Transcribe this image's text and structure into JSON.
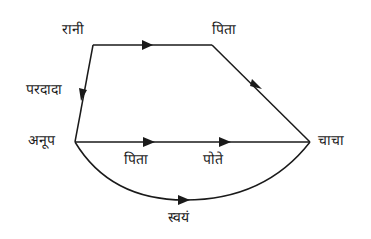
{
  "diagram": {
    "type": "family-relation-graph",
    "line_color": "#1a1a1a",
    "nodes": {
      "rani": "रानी",
      "pita_top": "पिता",
      "pardada": "परदादा",
      "anup": "अनूप",
      "chacha": "चाचा"
    },
    "edge_labels": {
      "pita_middle": "पिता",
      "pote": "पोते",
      "svayam": "स्वयं"
    },
    "edges": [
      {
        "from": "रानी",
        "to": "पिता",
        "direction": "right"
      },
      {
        "from": "पिता",
        "to": "चाचा",
        "direction": "down-right"
      },
      {
        "from": "रानी",
        "to": "अनूप",
        "label": "परदादा",
        "direction": "down"
      },
      {
        "from": "अनूप",
        "to": "चाचा",
        "labels": [
          "पिता",
          "पोते"
        ],
        "direction": "right"
      },
      {
        "from": "अनूप",
        "to": "चाचा",
        "label": "स्वयं",
        "shape": "curve"
      }
    ]
  }
}
